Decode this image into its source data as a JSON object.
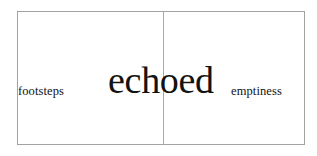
{
  "composition": {
    "title": "footsteps echoed emptiness",
    "background_color": "#ffffff",
    "frame": {
      "border_color": "#a2a2a2",
      "divider_color": "#a8a8a8"
    },
    "text_color": "#121212",
    "words": [
      {
        "id": "left",
        "text": "footsteps",
        "emphasis": "small",
        "panel": "left"
      },
      {
        "id": "center",
        "text": "echoed",
        "emphasis": "large",
        "panel": "straddles-divider"
      },
      {
        "id": "right",
        "text": "emptiness",
        "emphasis": "small",
        "panel": "right"
      }
    ]
  }
}
